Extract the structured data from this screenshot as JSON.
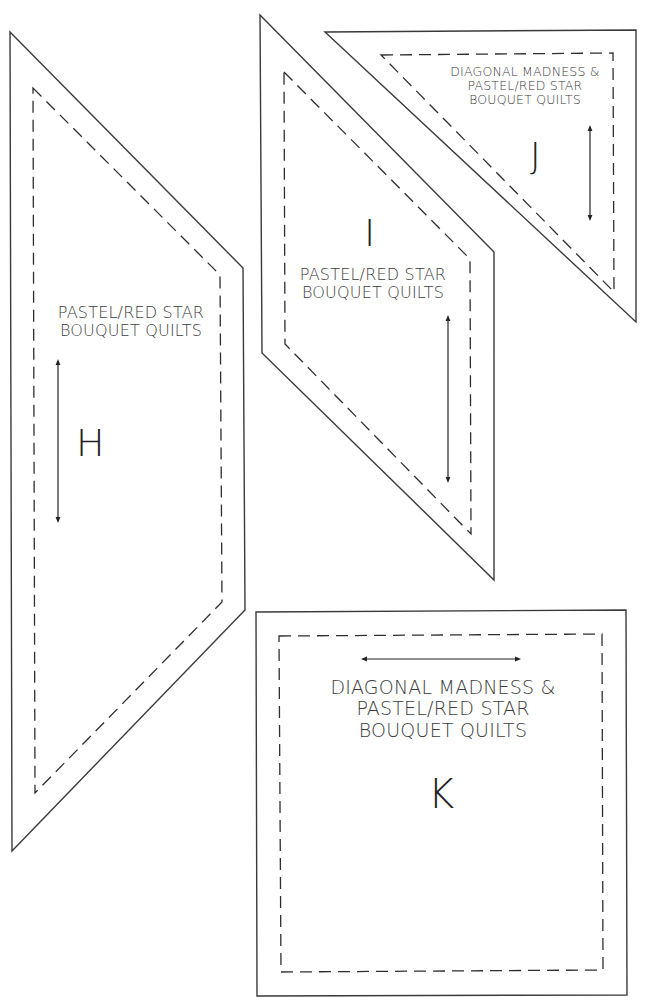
{
  "sheet": {
    "pieces": [
      {
        "id": "H",
        "letter": "H",
        "label_lines": [
          "PASTEL/RED STAR",
          "BOUQUET QUILTS"
        ],
        "grainline": "vertical"
      },
      {
        "id": "I",
        "letter": "I",
        "label_lines": [
          "PASTEL/RED STAR",
          "BOUQUET QUILTS"
        ],
        "grainline": "vertical"
      },
      {
        "id": "J",
        "letter": "J",
        "label_lines": [
          "DIAGONAL MADNESS &",
          "PASTEL/RED STAR",
          "BOUQUET QUILTS"
        ],
        "grainline": "vertical"
      },
      {
        "id": "K",
        "letter": "K",
        "label_lines": [
          "DIAGONAL MADNESS &",
          "PASTEL/RED STAR",
          "BOUQUET QUILTS"
        ],
        "grainline": "horizontal"
      }
    ]
  },
  "colors": {
    "cut_line": "#3a3a3a",
    "seam_line": "#2e2e2e",
    "text": "#3c3c3c",
    "background": "#ffffff"
  }
}
